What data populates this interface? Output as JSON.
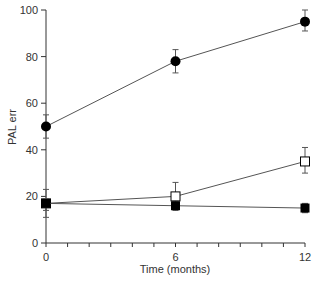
{
  "chart_data": {
    "type": "line",
    "title": "",
    "xlabel": "Time (months)",
    "ylabel": "PAL err",
    "x": [
      0,
      6,
      12
    ],
    "xticks": [
      0,
      6,
      12
    ],
    "xminor_step": 1,
    "yticks": [
      0,
      20,
      40,
      60,
      80,
      100
    ],
    "xlim": [
      0,
      12
    ],
    "ylim": [
      0,
      100
    ],
    "grid": false,
    "legend": null,
    "series": [
      {
        "name": "filled-circle",
        "marker": "circle-filled",
        "values": [
          50,
          78,
          95
        ],
        "err_low": [
          45,
          73,
          91
        ],
        "err_high": [
          55,
          83,
          100
        ]
      },
      {
        "name": "open-square",
        "marker": "square-open",
        "values": [
          17,
          20,
          35
        ],
        "err_low": [
          11,
          17,
          30
        ],
        "err_high": [
          23,
          26,
          41
        ]
      },
      {
        "name": "filled-square",
        "marker": "square-filled",
        "values": [
          17,
          16,
          15
        ],
        "err_low": [
          14,
          14,
          13
        ],
        "err_high": [
          19,
          18,
          17
        ]
      }
    ]
  },
  "colors": {
    "axis": "#333333",
    "line": "#555555",
    "marker": "#000000"
  }
}
